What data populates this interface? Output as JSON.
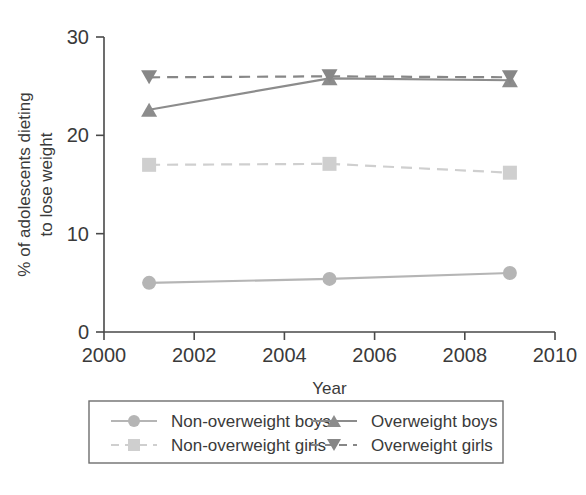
{
  "chart_data": {
    "type": "line",
    "title": "",
    "xlabel": "Year",
    "ylabel": "% of adolescents dieting to lose weight",
    "ylabel_line1": "% of adolescents dieting",
    "ylabel_line2": "to lose weight",
    "x": [
      2001,
      2005,
      2009
    ],
    "xlim": [
      2000,
      2010
    ],
    "ylim": [
      0,
      30
    ],
    "xticks": [
      2000,
      2002,
      2004,
      2006,
      2008,
      2010
    ],
    "xtick_labels": [
      "2000",
      "2002",
      "2004",
      "2006",
      "2008",
      "2010"
    ],
    "yticks": [
      0,
      10,
      20,
      30
    ],
    "ytick_labels": [
      "0",
      "10",
      "20",
      "30"
    ],
    "grid": false,
    "legend_position": "below",
    "series": [
      {
        "name": "Non-overweight boys",
        "values": [
          5.0,
          5.4,
          6.0
        ],
        "marker": "circle",
        "linestyle": "solid",
        "color": "#b5b5b5"
      },
      {
        "name": "Overweight boys",
        "values": [
          22.6,
          25.8,
          25.6
        ],
        "marker": "triangle-up",
        "linestyle": "solid",
        "color": "#8c8c8c"
      },
      {
        "name": "Non-overweight girls",
        "values": [
          17.0,
          17.1,
          16.2
        ],
        "marker": "square",
        "linestyle": "dashed",
        "color": "#cfcfcf"
      },
      {
        "name": "Overweight girls",
        "values": [
          25.9,
          26.0,
          25.9
        ],
        "marker": "triangle-down",
        "linestyle": "dashed",
        "color": "#878787"
      }
    ]
  },
  "legend": {
    "entries": [
      {
        "label": "Non-overweight boys",
        "marker": "circle",
        "linestyle": "solid",
        "color": "#b5b5b5"
      },
      {
        "label": "Overweight boys",
        "marker": "triangle-up",
        "linestyle": "solid",
        "color": "#8c8c8c"
      },
      {
        "label": "Non-overweight girls",
        "marker": "square",
        "linestyle": "dashed",
        "color": "#cfcfcf"
      },
      {
        "label": "Overweight girls",
        "marker": "triangle-down",
        "linestyle": "dashed",
        "color": "#878787"
      }
    ]
  }
}
